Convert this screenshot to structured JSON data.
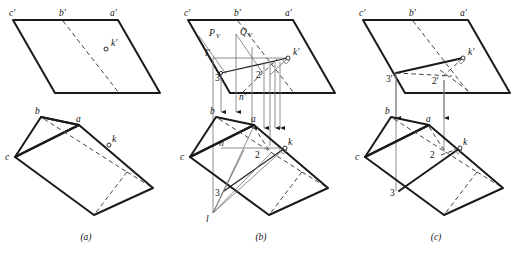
{
  "figure": {
    "panels": [
      {
        "id": "a",
        "caption": "(a)",
        "stage_note": "given: oblique plane and prism, front view above, top view below",
        "front_view_labels": [
          "c'",
          "b'",
          "a'",
          "k'"
        ],
        "top_view_labels": [
          "b",
          "a",
          "c",
          "k"
        ],
        "auxiliary_labels": []
      },
      {
        "id": "b",
        "caption": "(b)",
        "stage_note": "cutting planes Pv and Qv introduced, projectors carried down",
        "front_view_labels": [
          "c'",
          "b'",
          "a'",
          "k'",
          "l'",
          "3'",
          "2'",
          "n'"
        ],
        "top_view_labels": [
          "b",
          "a",
          "c",
          "k",
          "n",
          "2",
          "3",
          "l"
        ],
        "auxiliary_labels": [
          "Pv",
          "Qv"
        ]
      },
      {
        "id": "c",
        "caption": "(c)",
        "stage_note": "resulting line of intersection 3'-2'-k' and its top view 3-2-k",
        "front_view_labels": [
          "c'",
          "b'",
          "a'",
          "k'",
          "3'",
          "2'"
        ],
        "top_view_labels": [
          "b",
          "a",
          "c",
          "k",
          "2",
          "3"
        ],
        "auxiliary_labels": []
      }
    ],
    "trace_labels": {
      "p_letter": "P",
      "p_sub": "V",
      "q_letter": "Q",
      "q_sub": "V"
    },
    "point_labels": {
      "c_prime": "c'",
      "b_prime": "b'",
      "a_prime": "a'",
      "k_prime": "k'",
      "l_prime": "l'",
      "three_prime": "3'",
      "two_prime": "2'",
      "n_prime": "n'",
      "b": "b",
      "a": "a",
      "c": "c",
      "k": "k",
      "n": "n",
      "two": "2",
      "three": "3",
      "l": "l"
    },
    "captions": {
      "a": "(a)",
      "b": "(b)",
      "c": "(c)"
    },
    "colors": {
      "line": "#1a1a1a",
      "hidden_line": "#3a3a3a",
      "projector": "#7a7a7a",
      "background": "#ffffff"
    }
  }
}
